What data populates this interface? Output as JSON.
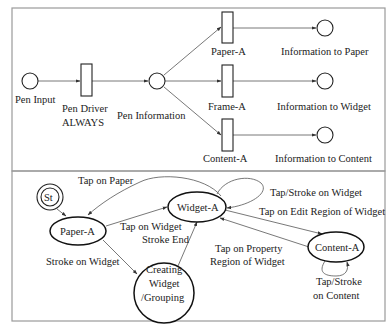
{
  "petri_net": {
    "places": {
      "pen_input": "Pen Input",
      "pen_information": "Pen Information",
      "info_to_paper": "Information to Paper",
      "info_to_widget": "Information to Widget",
      "info_to_content": "Information to Content"
    },
    "transitions": {
      "pen_driver_line1": "Pen Driver",
      "pen_driver_line2": "ALWAYS",
      "paper_a": "Paper-A",
      "frame_a": "Frame-A",
      "content_a": "Content-A"
    }
  },
  "state_machine": {
    "states": {
      "start": "St",
      "paper_a": "Paper-A",
      "widget_a": "Widget-A",
      "content_a": "Content-A",
      "creating_line1": "Creating",
      "creating_line2": "Widget",
      "creating_line3": "/Grouping"
    },
    "edges": {
      "tap_on_paper": "Tap on Paper",
      "tap_on_widget": "Tap on Widget",
      "stroke_end": "Stroke End",
      "stroke_on_widget": "Stroke on Widget",
      "tap_stroke_on_widget": "Tap/Stroke on Widget",
      "tap_on_edit_region": "Tap on Edit Region of Widget",
      "tap_on_property_line1": "Tap on Property",
      "tap_on_property_line2": "Region of  Widget",
      "tap_stroke_content_line1": "Tap/Stroke",
      "tap_stroke_content_line2": "on Content"
    }
  },
  "colors": {
    "frame": "#9a9a9a",
    "stroke": "#222222",
    "edge": "#555555",
    "background": "#ffffff"
  }
}
